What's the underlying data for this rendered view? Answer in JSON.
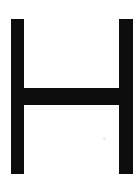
{
  "image": {
    "kind": "letterform-glyph",
    "character": "H",
    "description": "Uppercase letter H",
    "width": 140,
    "height": 185,
    "background_color": "#ffffff",
    "ink_color": "#0d0d0d",
    "speck_color": "#d8d8d8"
  },
  "glyph": {
    "label": "H",
    "strokes": [
      {
        "name": "stem-left",
        "role": "left vertical stem",
        "x": 11,
        "y": 19,
        "width": 13,
        "height": 155
      },
      {
        "name": "crossbar",
        "role": "horizontal crossbar",
        "x": 11,
        "y": 88,
        "width": 122,
        "height": 17
      },
      {
        "name": "stem-right",
        "role": "right vertical stem",
        "x": 119,
        "y": 19,
        "width": 14,
        "height": 155
      }
    ],
    "artifacts": [
      {
        "name": "scan-speck",
        "x": 103,
        "y": 137,
        "width": 3,
        "height": 3
      }
    ]
  }
}
